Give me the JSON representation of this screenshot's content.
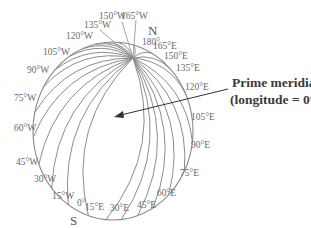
{
  "diagram": {
    "north_label": "N",
    "south_label": "S",
    "callout": {
      "line1": "Prime meridian",
      "line2": "(longitude = 0°)"
    },
    "meridians": [
      {
        "label": "165°W"
      },
      {
        "label": "150°W"
      },
      {
        "label": "135°W"
      },
      {
        "label": "120°W"
      },
      {
        "label": "105°W"
      },
      {
        "label": "90°W"
      },
      {
        "label": "75°W"
      },
      {
        "label": "60°W"
      },
      {
        "label": "45°W"
      },
      {
        "label": "30°W"
      },
      {
        "label": "15°W"
      },
      {
        "label": "0°"
      },
      {
        "label": "15°E"
      },
      {
        "label": "30°E"
      },
      {
        "label": "45°E"
      },
      {
        "label": "60°E"
      },
      {
        "label": "75°E"
      },
      {
        "label": "90°E"
      },
      {
        "label": "105°E"
      },
      {
        "label": "120°E"
      },
      {
        "label": "135°E"
      },
      {
        "label": "150°E"
      },
      {
        "label": "165°E"
      },
      {
        "label": "180°"
      }
    ],
    "colors": {
      "lines": "#8c8c8c",
      "labels": "#6a6a6a",
      "callout_text": "#3a3a3a",
      "arrow": "#333333"
    }
  }
}
